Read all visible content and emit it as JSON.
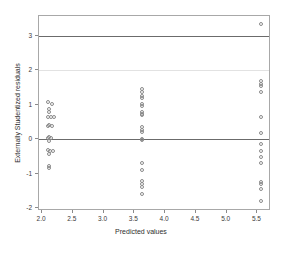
{
  "chart_data": {
    "type": "scatter",
    "title": "",
    "xlabel": "Predicted values",
    "ylabel": "Externally Studentized residuals",
    "xlim": [
      1.95,
      5.72
    ],
    "ylim": [
      -2.08,
      3.58
    ],
    "xticks": [
      2.0,
      2.5,
      3.0,
      3.5,
      4.0,
      4.5,
      5.0,
      5.5
    ],
    "xticklabels": [
      "2.0",
      "2.5",
      "3.0",
      "3.5",
      "4.0",
      "4.5",
      "5.0",
      "5.5"
    ],
    "yticks": [
      -2,
      -1,
      0,
      1,
      2,
      3
    ],
    "yticklabels": [
      "-2",
      "-1",
      "0",
      "1",
      "2",
      "3"
    ],
    "grid": false,
    "legend": null,
    "marker": "open-circle",
    "marker_color": "#8a8a8a",
    "reference_lines": [
      {
        "y": 3,
        "style": "solid",
        "color": "#6b6b6b",
        "weight": "strong"
      },
      {
        "y": 2,
        "style": "solid",
        "color": "#e2e2e2",
        "weight": "faint"
      },
      {
        "y": 0,
        "style": "solid",
        "color": "#6b6b6b",
        "weight": "strong"
      }
    ],
    "clusters": [
      {
        "x": 2.12,
        "label": "low-group"
      },
      {
        "x": 3.62,
        "label": "mid-group"
      },
      {
        "x": 5.55,
        "label": "high-group"
      }
    ],
    "points": [
      {
        "x": 2.1,
        "y": 1.07
      },
      {
        "x": 2.16,
        "y": 1.03
      },
      {
        "x": 2.12,
        "y": 0.88
      },
      {
        "x": 2.12,
        "y": 0.8
      },
      {
        "x": 2.09,
        "y": 0.66
      },
      {
        "x": 2.15,
        "y": 0.64
      },
      {
        "x": 2.2,
        "y": 0.64
      },
      {
        "x": 2.12,
        "y": 0.43
      },
      {
        "x": 2.09,
        "y": 0.4
      },
      {
        "x": 2.16,
        "y": 0.38
      },
      {
        "x": 2.12,
        "y": 0.07
      },
      {
        "x": 2.09,
        "y": 0.04
      },
      {
        "x": 2.15,
        "y": 0.03
      },
      {
        "x": 2.12,
        "y": -0.05
      },
      {
        "x": 2.09,
        "y": -0.3
      },
      {
        "x": 2.13,
        "y": -0.33
      },
      {
        "x": 2.18,
        "y": -0.33
      },
      {
        "x": 2.12,
        "y": -0.42
      },
      {
        "x": 2.12,
        "y": -0.78
      },
      {
        "x": 2.12,
        "y": -0.84
      },
      {
        "x": 3.62,
        "y": 1.46
      },
      {
        "x": 3.62,
        "y": 1.38
      },
      {
        "x": 3.62,
        "y": 1.26
      },
      {
        "x": 3.62,
        "y": 1.2
      },
      {
        "x": 3.62,
        "y": 1.04
      },
      {
        "x": 3.62,
        "y": 0.98
      },
      {
        "x": 3.62,
        "y": 0.8
      },
      {
        "x": 3.62,
        "y": 0.74
      },
      {
        "x": 3.62,
        "y": 0.7
      },
      {
        "x": 3.62,
        "y": 0.36
      },
      {
        "x": 3.62,
        "y": 0.28
      },
      {
        "x": 3.62,
        "y": 0.22
      },
      {
        "x": 3.62,
        "y": 0.02
      },
      {
        "x": 3.62,
        "y": -0.02
      },
      {
        "x": 3.62,
        "y": -0.7
      },
      {
        "x": 3.62,
        "y": -0.9
      },
      {
        "x": 3.62,
        "y": -1.22
      },
      {
        "x": 3.62,
        "y": -1.3
      },
      {
        "x": 3.62,
        "y": -1.38
      },
      {
        "x": 3.62,
        "y": -1.58
      },
      {
        "x": 5.56,
        "y": 3.36
      },
      {
        "x": 5.55,
        "y": 1.7
      },
      {
        "x": 5.55,
        "y": 1.62
      },
      {
        "x": 5.55,
        "y": 1.54
      },
      {
        "x": 5.55,
        "y": 1.36
      },
      {
        "x": 5.56,
        "y": 0.66
      },
      {
        "x": 5.56,
        "y": 0.17
      },
      {
        "x": 5.55,
        "y": -0.14
      },
      {
        "x": 5.55,
        "y": -0.34
      },
      {
        "x": 5.55,
        "y": -0.52
      },
      {
        "x": 5.55,
        "y": -0.7
      },
      {
        "x": 5.55,
        "y": -1.24
      },
      {
        "x": 5.55,
        "y": -1.3
      },
      {
        "x": 5.55,
        "y": -1.44
      },
      {
        "x": 5.55,
        "y": -1.8
      }
    ]
  }
}
